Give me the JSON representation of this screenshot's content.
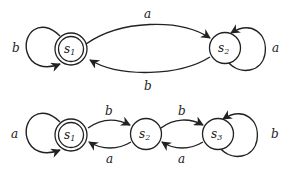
{
  "diagrams": [
    {
      "name": "automaton-1",
      "states": [
        {
          "id": "s1",
          "base": "s",
          "sub": "1",
          "accepting": true
        },
        {
          "id": "s2",
          "base": "s",
          "sub": "2",
          "accepting": false
        }
      ],
      "transitions": [
        {
          "from": "s1",
          "to": "s1",
          "label": "b"
        },
        {
          "from": "s1",
          "to": "s2",
          "label": "a"
        },
        {
          "from": "s2",
          "to": "s1",
          "label": "b"
        },
        {
          "from": "s2",
          "to": "s2",
          "label": "a"
        }
      ]
    },
    {
      "name": "automaton-2",
      "states": [
        {
          "id": "s1",
          "base": "s",
          "sub": "1",
          "accepting": true
        },
        {
          "id": "s2",
          "base": "s",
          "sub": "2",
          "accepting": false
        },
        {
          "id": "s3",
          "base": "s",
          "sub": "3",
          "accepting": false
        }
      ],
      "transitions": [
        {
          "from": "s1",
          "to": "s1",
          "label": "a"
        },
        {
          "from": "s1",
          "to": "s2",
          "label": "b"
        },
        {
          "from": "s2",
          "to": "s1",
          "label": "a"
        },
        {
          "from": "s2",
          "to": "s3",
          "label": "b"
        },
        {
          "from": "s3",
          "to": "s2",
          "label": "a"
        },
        {
          "from": "s3",
          "to": "s3",
          "label": "b"
        }
      ]
    }
  ]
}
